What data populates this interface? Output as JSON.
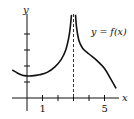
{
  "chart_data": {
    "type": "line",
    "title": "",
    "annotation": "y = f(x)",
    "xlabel": "x",
    "ylabel": "y",
    "x_tick_labels": [
      {
        "value": 1,
        "label": "1"
      },
      {
        "value": 5,
        "label": "5"
      }
    ],
    "x_ticks": [
      1,
      2,
      3,
      4,
      5
    ],
    "y_ticks": [
      1,
      2,
      3,
      4
    ],
    "xlim": [
      -0.9,
      6.0
    ],
    "ylim": [
      -0.3,
      5.3
    ],
    "vertical_asymptote": {
      "x": 3,
      "style": "dashed"
    },
    "series": [
      {
        "name": "f(x)",
        "branch": "left",
        "x": [
          -0.95,
          -0.6,
          -0.3,
          0.0,
          0.3,
          0.8,
          1.3,
          1.8,
          2.2,
          2.5,
          2.7,
          2.8,
          2.87
        ],
        "y": [
          1.75,
          1.55,
          1.42,
          1.38,
          1.38,
          1.45,
          1.6,
          1.95,
          2.4,
          3.0,
          3.8,
          4.5,
          5.2
        ]
      },
      {
        "name": "f(x)",
        "branch": "right",
        "x": [
          3.13,
          3.2,
          3.35,
          3.6,
          4.0,
          4.5,
          5.0,
          5.4,
          5.75
        ],
        "y": [
          5.2,
          4.4,
          3.6,
          3.1,
          2.75,
          2.35,
          1.85,
          1.2,
          0.6
        ]
      }
    ]
  }
}
